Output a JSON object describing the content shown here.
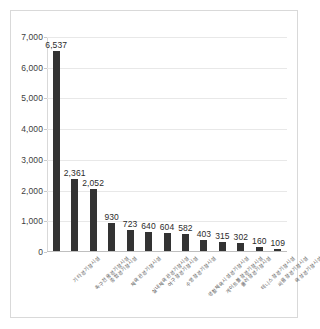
{
  "chart_data": {
    "type": "bar",
    "title": "",
    "subtitle": "",
    "xlabel": "",
    "ylabel": "",
    "categories": [
      "기타경기장시설",
      "축구전용경기장시설",
      "종합경기장시설",
      "체육관경기장시설",
      "실내체육관경기장시설",
      "야구장경기장시설",
      "수영장경기장시설",
      "생활체육시설경기장시설",
      "게이트볼장경기장시설",
      "롤러장경기장시설",
      "테니스장경기장시설",
      "씨름장경기장시설",
      "육상경기장시설"
    ],
    "values": [
      6537,
      2361,
      2052,
      930,
      723,
      640,
      604,
      582,
      403,
      315,
      302,
      160,
      109
    ],
    "value_labels": [
      "6,537",
      "2,361",
      "2,052",
      "930",
      "723",
      "640",
      "604",
      "582",
      "403",
      "315",
      "302",
      "160",
      "109"
    ],
    "ylim": [
      0,
      7000
    ],
    "ytick_values": [
      0,
      1000,
      2000,
      3000,
      4000,
      5000,
      6000,
      7000
    ],
    "ytick_labels": [
      "0",
      "1,000",
      "2,000",
      "3,000",
      "4,000",
      "5,000",
      "6,000",
      "7,000"
    ],
    "grid": true,
    "legend": false,
    "legend_position": "none",
    "bar_color": "#333333",
    "gridline_color": "#e8e8e8",
    "axis_color": "#bfbfbf",
    "plot_background": "#ffffff",
    "border_color": "#d9d9d9",
    "data_labels_shown": true,
    "category_label_rotation": -45
  }
}
